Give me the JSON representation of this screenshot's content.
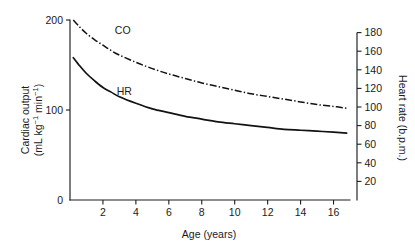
{
  "figure": {
    "background": "#ffffff",
    "line_color": "#121212"
  },
  "chart_data": {
    "type": "line",
    "title": "",
    "xlabel": "Age (years)",
    "xlim": [
      0,
      17
    ],
    "xticks": [
      2,
      4,
      6,
      8,
      10,
      12,
      14,
      16
    ],
    "grid": false,
    "legend_position": "inline-labels",
    "axes": [
      {
        "id": "left",
        "label_line1": "Cardiac output",
        "label_line2_prefix": "(mL kg",
        "label_line2_sup1": "−1",
        "label_line2_mid": " min",
        "label_line2_sup2": "−1",
        "label_line2_suffix": ")",
        "label_plain": "Cardiac output (mL kg−1 min−1)",
        "ticks": [
          0,
          100,
          200
        ],
        "ylim": [
          0,
          200
        ]
      },
      {
        "id": "right",
        "label_plain": "Heart rate (b.p.m.)",
        "ticks": [
          20,
          40,
          60,
          80,
          100,
          120,
          140,
          160,
          180
        ],
        "ylim": [
          0,
          200
        ]
      }
    ],
    "series": [
      {
        "name": "CO",
        "label": "CO",
        "axis": "left",
        "style": "dash-dot",
        "units": "mL kg−1 min−1",
        "x": [
          0.2,
          0.6,
          1,
          1.5,
          2,
          2.5,
          3,
          4,
          5,
          6,
          7,
          8,
          9,
          10,
          11,
          12,
          13,
          14,
          15,
          16,
          16.8
        ],
        "values": [
          200,
          192,
          185,
          178,
          172,
          166,
          161,
          153,
          146,
          140,
          135,
          130,
          126,
          122,
          118,
          115,
          112,
          109,
          106,
          104,
          102
        ]
      },
      {
        "name": "HR",
        "label": "HR",
        "axis": "right",
        "style": "solid",
        "units": "b.p.m.",
        "x": [
          0.2,
          0.6,
          1,
          1.5,
          2,
          2.5,
          3,
          4,
          5,
          6,
          7,
          8,
          9,
          10,
          11,
          12,
          13,
          14,
          15,
          16,
          16.8
        ],
        "values": [
          153,
          144,
          136,
          128,
          121,
          116,
          111,
          104,
          98,
          94,
          90,
          87,
          84,
          82,
          80,
          78,
          76,
          75,
          74,
          73,
          72
        ]
      }
    ],
    "series_label_positions": [
      {
        "name": "CO",
        "x": 3.2,
        "y_px": 34
      },
      {
        "name": "HR",
        "x": 3.3,
        "y_px": 95
      }
    ]
  }
}
